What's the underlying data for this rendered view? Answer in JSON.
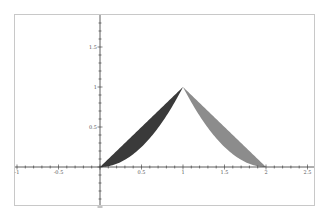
{
  "chart_data": {
    "type": "area",
    "title": "",
    "xlabel": "",
    "ylabel": "",
    "xlim": [
      -1,
      2.5
    ],
    "ylim": [
      -0.55,
      1.85
    ],
    "grid": false,
    "legend": null,
    "x_ticks": [
      "-1",
      "-0.5",
      "0.5",
      "1",
      "1.5",
      "2",
      "2.5"
    ],
    "y_ticks": [
      "0.5",
      "1",
      "1.5"
    ],
    "series": [
      {
        "name": "left region",
        "description": "Region between y = x and y = x^2 on [0, 1]",
        "upper": "x",
        "lower": "x^2",
        "x_range": [
          0,
          1
        ],
        "color": "#3a3a3a"
      },
      {
        "name": "right region",
        "description": "Region between y = 2 - x and y = (2 - x)^2 on [1, 2]",
        "upper": "2 - x",
        "lower": "(2 - x)^2",
        "x_range": [
          1,
          2
        ],
        "color": "#8c8c8c"
      }
    ],
    "vertices": [
      [
        0,
        0
      ],
      [
        1,
        1
      ],
      [
        2,
        0
      ]
    ]
  },
  "colors": {
    "frame": "#c8c8c8",
    "axis": "#333333",
    "left_fill": "#3a3a3a",
    "right_fill": "#8c8c8c"
  }
}
